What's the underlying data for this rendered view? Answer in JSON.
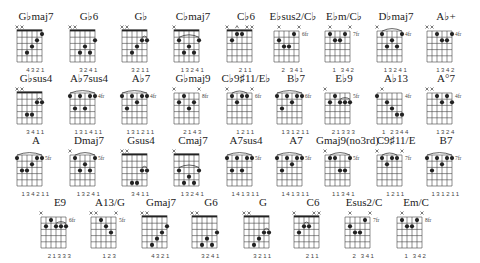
{
  "colors": {
    "ink": "#222222",
    "grid": "#444444",
    "background": "#ffffff"
  },
  "rows": [
    {
      "y": 10,
      "chords": [
        {
          "name": "G♭maj7",
          "x": 10,
          "fret": null,
          "nut": true,
          "markers": "xx----",
          "dots": [
            [
              3,
              4
            ],
            [
              4,
              3
            ],
            [
              5,
              2
            ],
            [
              6,
              1
            ]
          ],
          "barre": null,
          "fingers": "4321"
        },
        {
          "name": "G♭6",
          "x": 63,
          "fret": null,
          "nut": true,
          "markers": "xx----",
          "dots": [
            [
              3,
              4
            ],
            [
              4,
              3
            ],
            [
              5,
              4
            ],
            [
              6,
              2
            ]
          ],
          "barre": null,
          "fingers": "3241"
        },
        {
          "name": "G♭",
          "x": 115,
          "fret": null,
          "nut": true,
          "markers": "xx----",
          "dots": [
            [
              3,
              4
            ],
            [
              4,
              3
            ],
            [
              5,
              2
            ],
            [
              6,
              2
            ]
          ],
          "barre": [
            5,
            6,
            2,
            "arc"
          ],
          "fingers": "3211"
        },
        {
          "name": "C♭maj7",
          "x": 167,
          "fret": null,
          "nut": true,
          "markers": "x-----",
          "dots": [
            [
              2,
              2
            ],
            [
              3,
              4
            ],
            [
              4,
              3
            ],
            [
              5,
              4
            ],
            [
              6,
              2
            ]
          ],
          "barre": [
            2,
            6,
            2,
            "arc"
          ],
          "fingers": "13241"
        },
        {
          "name": "C♭6",
          "x": 220,
          "fret": null,
          "nut": true,
          "markers": "x-o-xx",
          "dots": [
            [
              2,
              2
            ],
            [
              3,
              1
            ],
            [
              4,
              1
            ]
          ],
          "barre": null,
          "fingers": "211"
        },
        {
          "name": "E♭sus2/C♭",
          "x": 267,
          "fret": "6fr",
          "nut": false,
          "markers": "-x---x",
          "dots": [
            [
              2,
              2
            ],
            [
              3,
              3
            ],
            [
              4,
              3
            ],
            [
              5,
              1
            ]
          ],
          "barre": null,
          "fingers": "2 341"
        },
        {
          "name": "E♭m/C♭",
          "x": 318,
          "fret": "7fr",
          "nut": false,
          "markers": "-x---x",
          "dots": [
            [
              2,
              1
            ],
            [
              3,
              2
            ],
            [
              4,
              2
            ],
            [
              5,
              1
            ]
          ],
          "barre": null,
          "fingers": "1 342"
        },
        {
          "name": "D♭maj7",
          "x": 370,
          "fret": "4fr",
          "nut": false,
          "markers": "x-----",
          "dots": [
            [
              2,
              1
            ],
            [
              3,
              3
            ],
            [
              4,
              2
            ],
            [
              5,
              3
            ],
            [
              6,
              1
            ]
          ],
          "barre": [
            2,
            6,
            1,
            "arc"
          ],
          "fingers": "13241"
        },
        {
          "name": "A♭+",
          "x": 420,
          "fret": "4fr",
          "nut": false,
          "markers": "xx----",
          "dots": [
            [
              3,
              1
            ],
            [
              4,
              2
            ],
            [
              5,
              2
            ],
            [
              6,
              1
            ]
          ],
          "barre": null,
          "fingers": "1342"
        }
      ]
    },
    {
      "y": 72,
      "chords": [
        {
          "name": "G♭sus4",
          "x": 10,
          "fret": null,
          "nut": true,
          "markers": "xx----",
          "dots": [
            [
              3,
              4
            ],
            [
              4,
              4
            ],
            [
              5,
              2
            ],
            [
              6,
              2
            ]
          ],
          "barre": [
            5,
            6,
            2,
            "arc"
          ],
          "fingers": "3411"
        },
        {
          "name": "A♭7sus4",
          "x": 63,
          "fret": "4fr",
          "nut": false,
          "markers": "------",
          "dots": [
            [
              1,
              1
            ],
            [
              2,
              3
            ],
            [
              3,
              1
            ],
            [
              4,
              3
            ],
            [
              5,
              1
            ],
            [
              6,
              1
            ]
          ],
          "barre": [
            1,
            6,
            1,
            "arc"
          ],
          "fingers": "131411"
        },
        {
          "name": "A♭7",
          "x": 115,
          "fret": "4fr",
          "nut": false,
          "markers": "------",
          "dots": [
            [
              1,
              1
            ],
            [
              2,
              3
            ],
            [
              3,
              1
            ],
            [
              4,
              2
            ],
            [
              5,
              1
            ],
            [
              6,
              1
            ]
          ],
          "barre": [
            1,
            6,
            1,
            "arc"
          ],
          "fingers": "131211"
        },
        {
          "name": "G♭maj9",
          "x": 167,
          "fret": "8fr",
          "nut": false,
          "markers": "x----x",
          "dots": [
            [
              2,
              2
            ],
            [
              3,
              1
            ],
            [
              4,
              3
            ],
            [
              5,
              2
            ]
          ],
          "barre": null,
          "fingers": "2143"
        },
        {
          "name": "C♭9♯11/E♭",
          "x": 220,
          "fret": "6fr",
          "nut": false,
          "markers": "x----x",
          "dots": [
            [
              2,
              1
            ],
            [
              3,
              2
            ],
            [
              4,
              1
            ],
            [
              5,
              1
            ]
          ],
          "barre": [
            2,
            5,
            1,
            "arc"
          ],
          "fingers": "1211"
        },
        {
          "name": "B♭7",
          "x": 270,
          "fret": "6fr",
          "nut": false,
          "markers": "------",
          "dots": [
            [
              1,
              1
            ],
            [
              2,
              3
            ],
            [
              3,
              1
            ],
            [
              4,
              2
            ],
            [
              5,
              1
            ],
            [
              6,
              1
            ]
          ],
          "barre": [
            1,
            6,
            1,
            "arc"
          ],
          "fingers": "131211"
        },
        {
          "name": "E♭9",
          "x": 318,
          "fret": "5fr",
          "nut": false,
          "markers": "x-----",
          "dots": [
            [
              2,
              2
            ],
            [
              3,
              1
            ],
            [
              4,
              2
            ],
            [
              5,
              2
            ],
            [
              6,
              2
            ]
          ],
          "barre": [
            4,
            6,
            2,
            "arc"
          ],
          "fingers": "21333"
        },
        {
          "name": "A♭13",
          "x": 370,
          "fret": "4fr",
          "nut": false,
          "markers": "-x----",
          "dots": [
            [
              1,
              1
            ],
            [
              3,
              2
            ],
            [
              4,
              3
            ],
            [
              5,
              4
            ],
            [
              6,
              4
            ]
          ],
          "barre": null,
          "fingers": "1 2344"
        },
        {
          "name": "A°7",
          "x": 420,
          "fret": "4fr",
          "nut": false,
          "markers": "xx----",
          "dots": [
            [
              3,
              1
            ],
            [
              4,
              2
            ],
            [
              5,
              1
            ],
            [
              6,
              2
            ]
          ],
          "barre": null,
          "fingers": "1324"
        }
      ]
    },
    {
      "y": 134,
      "chords": [
        {
          "name": "A",
          "x": 10,
          "fret": "5fr",
          "nut": false,
          "markers": "------",
          "dots": [
            [
              1,
              1
            ],
            [
              2,
              3
            ],
            [
              3,
              3
            ],
            [
              4,
              2
            ],
            [
              5,
              1
            ],
            [
              6,
              1
            ]
          ],
          "barre": [
            1,
            6,
            1,
            "arc"
          ],
          "fingers": "134211"
        },
        {
          "name": "Dmaj7",
          "x": 63,
          "fret": "5fr",
          "nut": false,
          "markers": "x-----",
          "dots": [
            [
              2,
              1
            ],
            [
              3,
              3
            ],
            [
              4,
              2
            ],
            [
              5,
              3
            ],
            [
              6,
              1
            ]
          ],
          "barre": [
            2,
            6,
            1,
            "arc"
          ],
          "fingers": "13241"
        },
        {
          "name": "Gsus4",
          "x": 115,
          "fret": null,
          "nut": true,
          "markers": "xx----",
          "dots": [
            [
              3,
              5
            ],
            [
              4,
              5
            ],
            [
              5,
              3
            ],
            [
              6,
              3
            ]
          ],
          "barre": [
            5,
            6,
            3,
            "arc"
          ],
          "fingers": "3411"
        },
        {
          "name": "Cmaj7",
          "x": 167,
          "fret": null,
          "nut": true,
          "markers": "x-----",
          "dots": [
            [
              2,
              3
            ],
            [
              3,
              5
            ],
            [
              4,
              4
            ],
            [
              5,
              5
            ],
            [
              6,
              3
            ]
          ],
          "barre": [
            2,
            6,
            3,
            "arc"
          ],
          "fingers": "13241"
        },
        {
          "name": "A7sus4",
          "x": 220,
          "fret": "5fr",
          "nut": false,
          "markers": "------",
          "dots": [
            [
              1,
              1
            ],
            [
              2,
              3
            ],
            [
              3,
              1
            ],
            [
              4,
              3
            ],
            [
              5,
              1
            ],
            [
              6,
              1
            ]
          ],
          "barre": [
            1,
            6,
            1,
            "arc"
          ],
          "fingers": "141311"
        },
        {
          "name": "A7",
          "x": 270,
          "fret": "5fr",
          "nut": false,
          "markers": "------",
          "dots": [
            [
              1,
              1
            ],
            [
              2,
              3
            ],
            [
              3,
              1
            ],
            [
              4,
              2
            ],
            [
              5,
              1
            ],
            [
              6,
              1
            ]
          ],
          "barre": [
            1,
            6,
            1,
            "arc"
          ],
          "fingers": "141311"
        },
        {
          "name": "Gmaj9(no3rd)",
          "x": 318,
          "fret": "5fr",
          "nut": false,
          "markers": "x-----",
          "dots": [
            [
              2,
              1
            ],
            [
              3,
              1
            ],
            [
              4,
              3
            ],
            [
              5,
              3
            ],
            [
              6,
              1
            ]
          ],
          "barre": [
            2,
            6,
            1,
            "arc"
          ],
          "fingers": "11341"
        },
        {
          "name": "C9♯11/E",
          "x": 370,
          "fret": "7fr",
          "nut": false,
          "markers": "x----x",
          "dots": [
            [
              2,
              1
            ],
            [
              3,
              2
            ],
            [
              4,
              1
            ],
            [
              5,
              1
            ]
          ],
          "barre": [
            2,
            5,
            1,
            "arc"
          ],
          "fingers": "1211"
        },
        {
          "name": "B7",
          "x": 420,
          "fret": "7fr",
          "nut": false,
          "markers": "------",
          "dots": [
            [
              1,
              1
            ],
            [
              2,
              3
            ],
            [
              3,
              1
            ],
            [
              4,
              2
            ],
            [
              5,
              1
            ],
            [
              6,
              1
            ]
          ],
          "barre": [
            1,
            6,
            1,
            "arc"
          ],
          "fingers": "131211"
        }
      ]
    },
    {
      "y": 196,
      "chords": [
        {
          "name": "E9",
          "x": 34,
          "fret": "6fr",
          "nut": false,
          "markers": "x-----",
          "dots": [
            [
              2,
              2
            ],
            [
              3,
              1
            ],
            [
              4,
              2
            ],
            [
              5,
              2
            ],
            [
              6,
              2
            ]
          ],
          "barre": [
            4,
            6,
            2,
            "arc"
          ],
          "fingers": "21333"
        },
        {
          "name": "A13/G",
          "x": 84,
          "fret": "5fr",
          "nut": false,
          "markers": "xx---x",
          "dots": [
            [
              3,
              1
            ],
            [
              4,
              2
            ],
            [
              5,
              3
            ]
          ],
          "barre": null,
          "fingers": "123"
        },
        {
          "name": "Gmaj7",
          "x": 135,
          "fret": null,
          "nut": true,
          "markers": "xx----",
          "dots": [
            [
              3,
              5
            ],
            [
              4,
              4
            ],
            [
              5,
              3
            ],
            [
              6,
              2
            ]
          ],
          "barre": null,
          "fingers": "4321"
        },
        {
          "name": "G6",
          "x": 185,
          "fret": null,
          "nut": true,
          "markers": "xx----",
          "dots": [
            [
              3,
              5
            ],
            [
              4,
              4
            ],
            [
              5,
              5
            ],
            [
              6,
              3
            ]
          ],
          "barre": null,
          "fingers": "3241"
        },
        {
          "name": "G",
          "x": 237,
          "fret": null,
          "nut": true,
          "markers": "xx----",
          "dots": [
            [
              3,
              5
            ],
            [
              4,
              4
            ],
            [
              5,
              3
            ],
            [
              6,
              3
            ]
          ],
          "barre": [
            5,
            6,
            3,
            "arc"
          ],
          "fingers": "3211"
        },
        {
          "name": "C6",
          "x": 287,
          "fret": null,
          "nut": true,
          "markers": "x---xx",
          "dots": [
            [
              2,
              3
            ],
            [
              3,
              2
            ],
            [
              4,
              2
            ]
          ],
          "barre": [
            3,
            4,
            2,
            "arc"
          ],
          "fingers": "211"
        },
        {
          "name": "Esus2/C",
          "x": 338,
          "fret": "7fr",
          "nut": false,
          "markers": "-x---x",
          "dots": [
            [
              2,
              2
            ],
            [
              3,
              3
            ],
            [
              4,
              3
            ],
            [
              5,
              1
            ]
          ],
          "barre": null,
          "fingers": "2 341"
        },
        {
          "name": "Em/C",
          "x": 390,
          "fret": "8fr",
          "nut": false,
          "markers": "-x---x",
          "dots": [
            [
              2,
              1
            ],
            [
              3,
              2
            ],
            [
              4,
              2
            ],
            [
              5,
              1
            ]
          ],
          "barre": null,
          "fingers": "1 342"
        }
      ]
    }
  ]
}
